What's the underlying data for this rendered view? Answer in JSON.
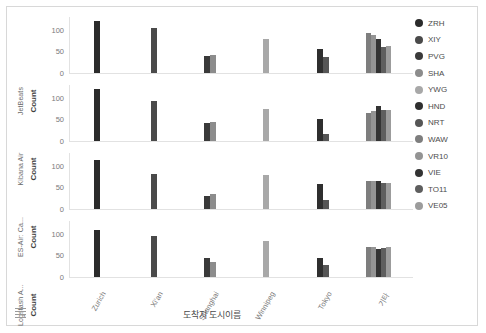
{
  "chart_data": {
    "type": "bar",
    "title": "",
    "xlabel": "도착지 도시이름",
    "ylabel": "Count",
    "ylim": [
      0,
      130
    ],
    "yticks": [
      0,
      50,
      100
    ],
    "grid": false,
    "legend_position": "right",
    "categories": [
      "Zurich",
      "Xi'an",
      "Shanghai",
      "Winnipeg",
      "Tokyo",
      "기타"
    ],
    "facet_variable": "Carrier",
    "facets": [
      "JetBeats",
      "Kibana Air",
      "ES-Air: Ca...",
      "Logstash A..."
    ],
    "series": [
      {
        "name": "ZRH",
        "color": "#2b2b2b"
      },
      {
        "name": "XIY",
        "color": "#4a4a4a"
      },
      {
        "name": "PVG",
        "color": "#3a3a3a"
      },
      {
        "name": "SHA",
        "color": "#8c8c8c"
      },
      {
        "name": "YWG",
        "color": "#a8a8a8"
      },
      {
        "name": "HND",
        "color": "#2f2f2f"
      },
      {
        "name": "NRT",
        "color": "#565656"
      },
      {
        "name": "WAW",
        "color": "#7e7e7e"
      },
      {
        "name": "VR10",
        "color": "#949494"
      },
      {
        "name": "VIE",
        "color": "#333333"
      },
      {
        "name": "TO11",
        "color": "#5e5e5e"
      },
      {
        "name": "VE05",
        "color": "#9c9c9c"
      }
    ],
    "panels": [
      {
        "facet": "JetBeats",
        "groups": [
          {
            "category": "Zurich",
            "bars": [
              {
                "series": "ZRH",
                "value": 121
              }
            ]
          },
          {
            "category": "Xi'an",
            "bars": [
              {
                "series": "XIY",
                "value": 104
              }
            ]
          },
          {
            "category": "Shanghai",
            "bars": [
              {
                "series": "PVG",
                "value": 40
              },
              {
                "series": "SHA",
                "value": 41
              }
            ]
          },
          {
            "category": "Winnipeg",
            "bars": [
              {
                "series": "YWG",
                "value": 78
              }
            ]
          },
          {
            "category": "Tokyo",
            "bars": [
              {
                "series": "HND",
                "value": 56
              },
              {
                "series": "NRT",
                "value": 37
              }
            ]
          },
          {
            "category": "기타",
            "bars": [
              {
                "series": "WAW",
                "value": 94
              },
              {
                "series": "VR10",
                "value": 89
              },
              {
                "series": "VIE",
                "value": 78
              },
              {
                "series": "TO11",
                "value": 61
              },
              {
                "series": "VE05",
                "value": 62
              }
            ]
          }
        ]
      },
      {
        "facet": "Kibana Air",
        "groups": [
          {
            "category": "Zurich",
            "bars": [
              {
                "series": "ZRH",
                "value": 120
              }
            ]
          },
          {
            "category": "Xi'an",
            "bars": [
              {
                "series": "XIY",
                "value": 94
              }
            ]
          },
          {
            "category": "Shanghai",
            "bars": [
              {
                "series": "PVG",
                "value": 42
              },
              {
                "series": "SHA",
                "value": 44
              }
            ]
          },
          {
            "category": "Winnipeg",
            "bars": [
              {
                "series": "YWG",
                "value": 75
              }
            ]
          },
          {
            "category": "Tokyo",
            "bars": [
              {
                "series": "HND",
                "value": 50
              },
              {
                "series": "NRT",
                "value": 17
              }
            ]
          },
          {
            "category": "기타",
            "bars": [
              {
                "series": "WAW",
                "value": 66
              },
              {
                "series": "VR10",
                "value": 70
              },
              {
                "series": "VIE",
                "value": 82
              },
              {
                "series": "TO11",
                "value": 72
              },
              {
                "series": "VE05",
                "value": 73
              }
            ]
          }
        ]
      },
      {
        "facet": "ES-Air: Ca...",
        "groups": [
          {
            "category": "Zurich",
            "bars": [
              {
                "series": "ZRH",
                "value": 114
              }
            ]
          },
          {
            "category": "Xi'an",
            "bars": [
              {
                "series": "XIY",
                "value": 82
              }
            ]
          },
          {
            "category": "Shanghai",
            "bars": [
              {
                "series": "PVG",
                "value": 30
              },
              {
                "series": "SHA",
                "value": 36
              }
            ]
          },
          {
            "category": "Winnipeg",
            "bars": [
              {
                "series": "YWG",
                "value": 79
              }
            ]
          },
          {
            "category": "Tokyo",
            "bars": [
              {
                "series": "HND",
                "value": 58
              },
              {
                "series": "NRT",
                "value": 22
              }
            ]
          },
          {
            "category": "기타",
            "bars": [
              {
                "series": "WAW",
                "value": 64
              },
              {
                "series": "VR10",
                "value": 66
              },
              {
                "series": "VIE",
                "value": 64
              },
              {
                "series": "TO11",
                "value": 61
              },
              {
                "series": "VE05",
                "value": 61
              }
            ]
          }
        ]
      },
      {
        "facet": "Logstash A...",
        "groups": [
          {
            "category": "Zurich",
            "bars": [
              {
                "series": "ZRH",
                "value": 108
              }
            ]
          },
          {
            "category": "Xi'an",
            "bars": [
              {
                "series": "XIY",
                "value": 95
              }
            ]
          },
          {
            "category": "Shanghai",
            "bars": [
              {
                "series": "PVG",
                "value": 45
              },
              {
                "series": "SHA",
                "value": 36
              }
            ]
          },
          {
            "category": "Winnipeg",
            "bars": [
              {
                "series": "YWG",
                "value": 83
              }
            ]
          },
          {
            "category": "Tokyo",
            "bars": [
              {
                "series": "HND",
                "value": 45
              },
              {
                "series": "NRT",
                "value": 29
              }
            ]
          },
          {
            "category": "기타",
            "bars": [
              {
                "series": "WAW",
                "value": 69
              },
              {
                "series": "VR10",
                "value": 69
              },
              {
                "series": "VIE",
                "value": 66
              },
              {
                "series": "TO11",
                "value": 68
              },
              {
                "series": "VE05",
                "value": 69
              }
            ]
          }
        ]
      }
    ]
  },
  "corner": {
    "icon": "legend-list-icon"
  }
}
